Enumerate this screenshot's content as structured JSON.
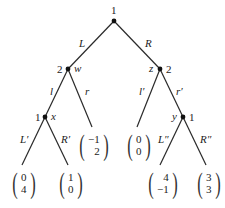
{
  "diagram": {
    "type": "extensive-form game tree",
    "nodes": [
      {
        "id": "root",
        "player": "1",
        "name": "",
        "x": 114,
        "y": 21
      },
      {
        "id": "w",
        "player": "2",
        "name": "w",
        "x": 68,
        "y": 69
      },
      {
        "id": "z",
        "player": "2",
        "name": "z",
        "x": 160,
        "y": 69
      },
      {
        "id": "x",
        "player": "1",
        "name": "x",
        "x": 45,
        "y": 117
      },
      {
        "id": "y",
        "player": "1",
        "name": "y",
        "x": 183,
        "y": 117
      }
    ],
    "edges": [
      {
        "from": "root",
        "to": "w",
        "label": "L"
      },
      {
        "from": "root",
        "to": "z",
        "label": "R"
      },
      {
        "from": "w",
        "to": "x",
        "label": "l"
      },
      {
        "from": "w",
        "to": "t_r",
        "label": "r"
      },
      {
        "from": "z",
        "to": "t_lp",
        "label": "l′"
      },
      {
        "from": "z",
        "to": "y",
        "label": "r′"
      },
      {
        "from": "x",
        "to": "t_Lp",
        "label": "L′"
      },
      {
        "from": "x",
        "to": "t_Rp",
        "label": "R′"
      },
      {
        "from": "y",
        "to": "t_Lpp",
        "label": "L″"
      },
      {
        "from": "y",
        "to": "t_Rpp",
        "label": "R″"
      }
    ],
    "payoffs": [
      {
        "id": "t_Lp",
        "p1": "0",
        "p2": "4"
      },
      {
        "id": "t_Rp",
        "p1": "1",
        "p2": "0"
      },
      {
        "id": "t_r",
        "p1": "−1",
        "p2": "2"
      },
      {
        "id": "t_lp",
        "p1": "0",
        "p2": "0"
      },
      {
        "id": "t_Lpp",
        "p1": "4",
        "p2": "−1"
      },
      {
        "id": "t_Rpp",
        "p1": "3",
        "p2": "3"
      }
    ],
    "labels": {
      "root_player": "1",
      "w_player": "2",
      "w_name": "w",
      "z_player": "2",
      "z_name": "z",
      "x_player": "1",
      "x_name": "x",
      "y_player": "1",
      "y_name": "y",
      "L": "L",
      "R": "R",
      "l": "l",
      "r": "r",
      "lp": "l′",
      "rp": "r′",
      "Lp": "L′",
      "Rp": "R′",
      "Lpp": "L″",
      "Rpp": "R″"
    }
  }
}
